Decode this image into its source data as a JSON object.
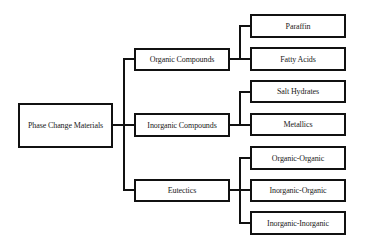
{
  "diagram": {
    "type": "tree",
    "root": {
      "label": "Phase Change Materials"
    },
    "categories": [
      {
        "label": "Organic Compounds",
        "children": [
          {
            "label": "Paraffin"
          },
          {
            "label": "Fatty Acids"
          }
        ]
      },
      {
        "label": "Inorganic Compounds",
        "children": [
          {
            "label": "Salt Hydrates"
          },
          {
            "label": "Metallics"
          }
        ]
      },
      {
        "label": "Eutectics",
        "children": [
          {
            "label": "Organic-Organic"
          },
          {
            "label": "Inorganic-Organic"
          },
          {
            "label": "Inorganic-Inorganic"
          }
        ]
      }
    ],
    "colors": {
      "line": "#111111",
      "box_border": "#111111",
      "text": "#1a1a1a",
      "background": "#ffffff"
    }
  }
}
